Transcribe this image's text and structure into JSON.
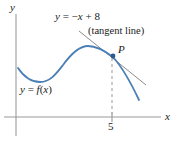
{
  "figure": {
    "axes": {
      "y_label": "y",
      "x_label": "x"
    },
    "labels": {
      "line_equation": "y = −x + 8",
      "tangent_note": "(tangent line)",
      "point": "P",
      "function": "y = f(x)"
    },
    "ticks": {
      "x": [
        {
          "value": "5"
        }
      ]
    },
    "colors": {
      "curve": "#4a7fb5",
      "point": "#2d5a8e",
      "axis": "#9a9a9a",
      "tangent": "#8d8d8d",
      "dashed_guide": "#b0b0b0",
      "text": "#1a1a1a",
      "background": "#ffffff"
    }
  },
  "chart_data": {
    "type": "line",
    "title": "",
    "xlabel": "x",
    "ylabel": "y",
    "grid": false,
    "legend": "none",
    "annotations": [
      {
        "name": "line-equation",
        "text": "y = −x + 8"
      },
      {
        "name": "tangent-note",
        "text": "(tangent line)"
      },
      {
        "name": "point-label",
        "text": "P"
      },
      {
        "name": "function-label",
        "text": "y = f(x)"
      },
      {
        "name": "x-tick",
        "text": "5"
      }
    ],
    "series": [
      {
        "name": "y = f(x)",
        "type": "curve",
        "points_px": [
          [
            18,
            68
          ],
          [
            24,
            75
          ],
          [
            31,
            80
          ],
          [
            40,
            82
          ],
          [
            50,
            79
          ],
          [
            60,
            70
          ],
          [
            70,
            58
          ],
          [
            80,
            49
          ],
          [
            88,
            46
          ],
          [
            96,
            47
          ],
          [
            104,
            51
          ],
          [
            113,
            56
          ],
          [
            122,
            66
          ],
          [
            130,
            79
          ],
          [
            136,
            92
          ],
          [
            139,
            100
          ]
        ]
      },
      {
        "name": "y = -x + 8",
        "type": "tangent-line",
        "points_px": [
          [
            79,
            31
          ],
          [
            146,
            85
          ]
        ]
      }
    ],
    "markers": [
      {
        "name": "P",
        "x_px": 113,
        "y_px": 56
      }
    ],
    "guides": [
      {
        "name": "vertical-dashed-at-5",
        "x_px": 112,
        "y_top_px": 58,
        "y_bottom_px": 117
      }
    ],
    "axis_geometry_px": {
      "origin": [
        16,
        117
      ],
      "x_axis": [
        [
          4,
          117
        ],
        [
          161,
          117
        ]
      ],
      "y_axis": [
        [
          16,
          14
        ],
        [
          16,
          136
        ]
      ],
      "tick_5": {
        "x_px": 112,
        "y_top_px": 112,
        "y_bottom_px": 122
      }
    }
  }
}
